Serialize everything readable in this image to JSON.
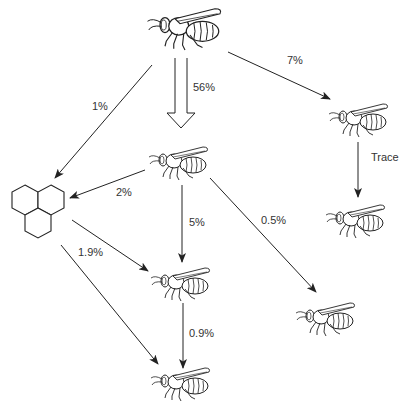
{
  "diagram": {
    "nodes": [
      {
        "id": "queen",
        "type": "bee",
        "label": "",
        "x": 190,
        "y": 25,
        "scale": 1.25
      },
      {
        "id": "worker-top-right",
        "type": "bee",
        "label": "",
        "x": 363,
        "y": 117,
        "scale": 1.0
      },
      {
        "id": "worker-middle",
        "type": "bee",
        "label": "",
        "x": 183,
        "y": 160,
        "scale": 1.0
      },
      {
        "id": "honeycomb",
        "type": "comb",
        "label": "",
        "x": 38,
        "y": 212
      },
      {
        "id": "worker-right-middle",
        "type": "bee",
        "label": "",
        "x": 360,
        "y": 218,
        "scale": 1.0
      },
      {
        "id": "worker-center-lower",
        "type": "bee",
        "label": "",
        "x": 185,
        "y": 281,
        "scale": 1.0
      },
      {
        "id": "worker-right-lower",
        "type": "bee",
        "label": "",
        "x": 330,
        "y": 316,
        "scale": 1.0
      },
      {
        "id": "worker-bottom",
        "type": "bee",
        "label": "",
        "x": 185,
        "y": 381,
        "scale": 1.0
      }
    ],
    "edges": [
      {
        "from": "queen",
        "to": "honeycomb",
        "label": "1%"
      },
      {
        "from": "queen",
        "to": "worker-middle",
        "label": "56%",
        "style": "hollow"
      },
      {
        "from": "queen",
        "to": "worker-top-right",
        "label": "7%"
      },
      {
        "from": "worker-top-right",
        "to": "worker-right-middle",
        "label": "Trace"
      },
      {
        "from": "worker-middle",
        "to": "honeycomb",
        "label": "2%"
      },
      {
        "from": "worker-middle",
        "to": "worker-center-lower",
        "label": "5%"
      },
      {
        "from": "worker-middle",
        "to": "worker-right-lower",
        "label": "0.5%"
      },
      {
        "from": "honeycomb",
        "to": "worker-center-lower",
        "label": "1.9%"
      },
      {
        "from": "honeycomb",
        "to": "worker-bottom",
        "label": ""
      },
      {
        "from": "worker-center-lower",
        "to": "worker-bottom",
        "label": "0.9%"
      }
    ]
  },
  "labels": {
    "q_comb": "1%",
    "q_mid": "56%",
    "q_tr": "7%",
    "tr_rm": "Trace",
    "mid_comb": "2%",
    "mid_cl": "5%",
    "mid_rl": "0.5%",
    "comb_cl": "1.9%",
    "cl_bot": "0.9%"
  },
  "colors": {
    "line": "#222222",
    "background": "#ffffff"
  }
}
